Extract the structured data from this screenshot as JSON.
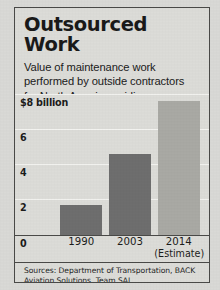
{
  "chart_data": {
    "type": "bar",
    "title": "Outsourced Work",
    "subtitle_lines": [
      "Value of maintenance work",
      "performed by outside contractors",
      "for North American airlines:"
    ],
    "categories": [
      "1990",
      "2003",
      "2014"
    ],
    "category_sublabels": [
      "",
      "",
      "(Estimate)"
    ],
    "values": [
      1.7,
      4.6,
      7.6
    ],
    "xlabel": "",
    "ylabel": "",
    "ylim": [
      0,
      8
    ],
    "yticks": [
      0,
      2,
      4,
      6,
      8
    ],
    "ytick_labels": [
      "0",
      "2",
      "4",
      "6",
      "$8 billion"
    ],
    "grid": true,
    "legend": "none",
    "units": "billions of dollars",
    "series_colors": [
      "#6e6e6e",
      "#6e6e6e",
      "#a9a9a4"
    ],
    "source_note": "Sources: Department of Transportation, BACK Aviation Solutions, Team SAI"
  },
  "colors": {
    "paper": "#d9d9d6",
    "panel": "#dcdcd8",
    "border": "#4a4a48",
    "gridline": "#f3f3f0",
    "bar_dark": "#6e6e6e",
    "bar_light": "#a9a9a4",
    "text": "#1a1a1a"
  }
}
